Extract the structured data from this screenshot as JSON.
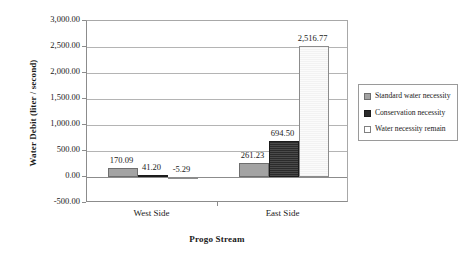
{
  "chart_data": {
    "type": "bar",
    "title": "",
    "xlabel": "Progo Stream",
    "ylabel": "Water Debit (liter / second)",
    "categories": [
      "West Side",
      "East Side"
    ],
    "series": [
      {
        "name": "Standard water necessity",
        "values": [
          170.09,
          261.23
        ],
        "labels": [
          "170.09",
          "261.23"
        ],
        "color": "#a3a3a3"
      },
      {
        "name": "Conservation necessity",
        "values": [
          41.2,
          694.5
        ],
        "labels": [
          "41.20",
          "694.50"
        ],
        "color": "#2b2b2b"
      },
      {
        "name": "Water necessity remain",
        "values": [
          -5.29,
          2516.77
        ],
        "labels": [
          "-5.29",
          "2,516.77"
        ],
        "color": "#f7f7f7"
      }
    ],
    "ylim": [
      -500,
      3000
    ],
    "ystep": 500,
    "ytick_labels": [
      "3,000.00",
      "2,500.00",
      "2,000.00",
      "1,500.00",
      "1,000.00",
      "500.00",
      "0.00",
      "-500.00"
    ],
    "ytick_values": [
      3000,
      2500,
      2000,
      1500,
      1000,
      500,
      0,
      -500
    ],
    "grid": true,
    "legend_position": "right",
    "legend_entries": [
      "Standard water necessity",
      "Conservation necessity",
      "Water necessity remain"
    ]
  }
}
